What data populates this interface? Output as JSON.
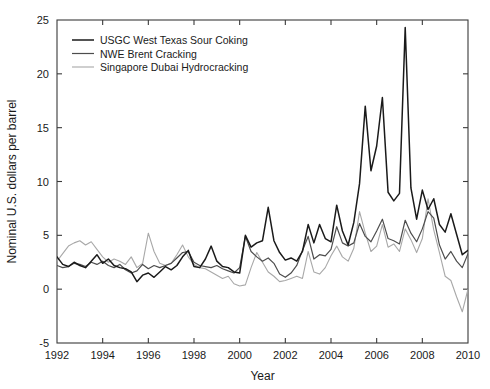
{
  "chart_data": {
    "type": "line",
    "title": "",
    "xlabel": "Year",
    "ylabel": "Nominal U.S. dollars per barrel",
    "xlim": [
      1992,
      2010
    ],
    "ylim": [
      -5,
      25
    ],
    "xticks": [
      1992,
      1994,
      1996,
      1998,
      2000,
      2002,
      2004,
      2006,
      2008,
      2010
    ],
    "xtick_labels": [
      "1992",
      "1994",
      "1996",
      "1998",
      "2000",
      "2002",
      "2004",
      "2006",
      "2008",
      "2010"
    ],
    "yticks": [
      -5,
      0,
      5,
      10,
      15,
      20,
      25
    ],
    "ytick_labels": [
      "-5",
      "0",
      "5",
      "10",
      "15",
      "20",
      "25"
    ],
    "grid": false,
    "legend_position": "top-left",
    "series": [
      {
        "name": "USGC West Texas Sour Coking",
        "color": "#1a1a1a",
        "width": 1.5,
        "x": [
          1992.0,
          1992.25,
          1992.5,
          1992.75,
          1993.0,
          1993.25,
          1993.5,
          1993.75,
          1994.0,
          1994.25,
          1994.5,
          1994.75,
          1995.0,
          1995.25,
          1995.5,
          1995.75,
          1996.0,
          1996.25,
          1996.5,
          1996.75,
          1997.0,
          1997.25,
          1997.5,
          1997.75,
          1998.0,
          1998.25,
          1998.5,
          1998.75,
          1999.0,
          1999.25,
          1999.5,
          1999.75,
          2000.0,
          2000.25,
          2000.5,
          2000.75,
          2001.0,
          2001.25,
          2001.5,
          2001.75,
          2002.0,
          2002.25,
          2002.5,
          2002.75,
          2003.0,
          2003.25,
          2003.5,
          2003.75,
          2004.0,
          2004.25,
          2004.5,
          2004.75,
          2005.0,
          2005.25,
          2005.5,
          2005.75,
          2006.0,
          2006.25,
          2006.5,
          2006.75,
          2007.0,
          2007.25,
          2007.5,
          2007.75,
          2008.0,
          2008.25,
          2008.5,
          2008.75,
          2009.0,
          2009.25,
          2009.5,
          2009.75,
          2010.0
        ],
        "y": [
          3.0,
          2.3,
          2.1,
          2.5,
          2.2,
          2.0,
          2.6,
          3.2,
          2.4,
          2.8,
          2.2,
          2.0,
          1.9,
          1.6,
          0.7,
          1.3,
          1.5,
          1.1,
          1.6,
          2.1,
          1.8,
          2.2,
          3.0,
          3.6,
          2.1,
          2.0,
          2.8,
          4.0,
          2.6,
          2.1,
          2.0,
          1.6,
          1.5,
          5.0,
          3.9,
          4.3,
          4.5,
          7.6,
          4.5,
          3.4,
          2.7,
          2.9,
          2.6,
          3.5,
          6.0,
          4.3,
          6.0,
          4.7,
          4.4,
          7.8,
          5.4,
          4.1,
          6.2,
          9.8,
          17.0,
          11.0,
          13.3,
          17.8,
          9.0,
          8.2,
          8.9,
          24.3,
          9.4,
          6.5,
          9.2,
          7.4,
          8.4,
          6.0,
          5.3,
          7.0,
          5.1,
          3.2,
          3.6
        ]
      },
      {
        "name": "NWE Brent Cracking",
        "color": "#4d4d4d",
        "width": 1.2,
        "x": [
          1992.0,
          1992.25,
          1992.5,
          1992.75,
          1993.0,
          1993.25,
          1993.5,
          1993.75,
          1994.0,
          1994.25,
          1994.5,
          1994.75,
          1995.0,
          1995.25,
          1995.5,
          1995.75,
          1996.0,
          1996.25,
          1996.5,
          1996.75,
          1997.0,
          1997.25,
          1997.5,
          1997.75,
          1998.0,
          1998.25,
          1998.5,
          1998.75,
          1999.0,
          1999.25,
          1999.5,
          1999.75,
          2000.0,
          2000.25,
          2000.5,
          2000.75,
          2001.0,
          2001.25,
          2001.5,
          2001.75,
          2002.0,
          2002.25,
          2002.5,
          2002.75,
          2003.0,
          2003.25,
          2003.5,
          2003.75,
          2004.0,
          2004.25,
          2004.5,
          2004.75,
          2005.0,
          2005.25,
          2005.5,
          2005.75,
          2006.0,
          2006.25,
          2006.5,
          2006.75,
          2007.0,
          2007.25,
          2007.5,
          2007.75,
          2008.0,
          2008.25,
          2008.5,
          2008.75,
          2009.0,
          2009.25,
          2009.5,
          2009.75,
          2010.0
        ],
        "y": [
          2.2,
          2.0,
          2.1,
          2.4,
          2.3,
          2.1,
          2.5,
          2.3,
          2.6,
          2.2,
          2.0,
          2.3,
          1.8,
          1.5,
          1.7,
          2.3,
          1.9,
          2.2,
          2.0,
          2.2,
          2.4,
          2.9,
          3.4,
          3.5,
          2.5,
          2.2,
          2.1,
          2.0,
          2.2,
          1.9,
          1.7,
          1.5,
          2.0,
          4.9,
          3.5,
          3.0,
          2.6,
          2.9,
          2.4,
          1.4,
          1.1,
          1.5,
          2.2,
          3.6,
          4.9,
          2.8,
          3.2,
          3.1,
          3.7,
          5.8,
          4.3,
          4.0,
          4.3,
          6.1,
          4.9,
          4.4,
          5.4,
          6.5,
          4.7,
          4.5,
          4.2,
          6.4,
          5.2,
          4.4,
          5.6,
          7.2,
          6.6,
          4.1,
          2.8,
          3.5,
          2.6,
          2.0,
          3.3
        ]
      },
      {
        "name": "Singapore Dubai Hydrocracking",
        "color": "#a8a8a8",
        "width": 1.1,
        "x": [
          1992.0,
          1992.25,
          1992.5,
          1992.75,
          1993.0,
          1993.25,
          1993.5,
          1993.75,
          1994.0,
          1994.25,
          1994.5,
          1994.75,
          1995.0,
          1995.25,
          1995.5,
          1995.75,
          1996.0,
          1996.25,
          1996.5,
          1996.75,
          1997.0,
          1997.25,
          1997.5,
          1997.75,
          1998.0,
          1998.25,
          1998.5,
          1998.75,
          1999.0,
          1999.25,
          1999.5,
          1999.75,
          2000.0,
          2000.25,
          2000.5,
          2000.75,
          2001.0,
          2001.25,
          2001.5,
          2001.75,
          2002.0,
          2002.25,
          2002.5,
          2002.75,
          2003.0,
          2003.25,
          2003.5,
          2003.75,
          2004.0,
          2004.25,
          2004.5,
          2004.75,
          2005.0,
          2005.25,
          2005.5,
          2005.75,
          2006.0,
          2006.25,
          2006.5,
          2006.75,
          2007.0,
          2007.25,
          2007.5,
          2007.75,
          2008.0,
          2008.25,
          2008.5,
          2008.75,
          2009.0,
          2009.25,
          2009.5,
          2009.75,
          2010.0
        ],
        "y": [
          2.6,
          3.3,
          4.0,
          4.3,
          4.5,
          4.1,
          4.4,
          3.7,
          3.0,
          2.5,
          2.8,
          2.6,
          2.3,
          3.0,
          2.0,
          2.4,
          5.2,
          3.5,
          2.4,
          2.2,
          2.4,
          3.2,
          4.1,
          3.0,
          2.3,
          2.0,
          1.9,
          1.6,
          1.3,
          1.0,
          1.2,
          0.5,
          0.3,
          0.4,
          2.0,
          3.4,
          2.5,
          1.6,
          1.2,
          0.7,
          0.8,
          1.0,
          1.2,
          1.0,
          3.5,
          1.6,
          1.4,
          2.0,
          3.1,
          4.0,
          3.0,
          2.6,
          3.8,
          7.2,
          5.2,
          3.5,
          4.0,
          6.0,
          3.9,
          4.2,
          3.5,
          5.6,
          4.6,
          3.4,
          4.7,
          8.4,
          5.5,
          3.4,
          1.2,
          0.8,
          -0.7,
          -2.1,
          0.0
        ]
      }
    ]
  },
  "legend": {
    "entries": [
      {
        "label": "USGC West Texas Sour Coking"
      },
      {
        "label": "NWE Brent Cracking"
      },
      {
        "label": "Singapore Dubai Hydrocracking"
      }
    ]
  }
}
